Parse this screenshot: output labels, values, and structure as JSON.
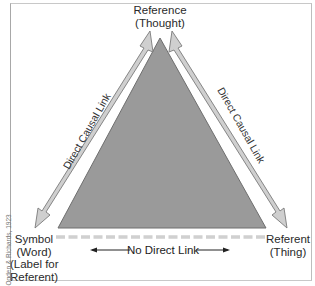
{
  "diagram": {
    "type": "semiotic-triangle",
    "nodes": {
      "top": {
        "line1": "Reference",
        "line2": "(Thought)"
      },
      "bottom_left": {
        "line1": "Symbol",
        "line2": "(Word)",
        "line3": "(Label for",
        "line4": "Referent)"
      },
      "bottom_right": {
        "line1": "Referent",
        "line2": "(Thing)"
      }
    },
    "edges": {
      "left": {
        "label": "Direct Causal Link",
        "style": "double-headed-arrow"
      },
      "right": {
        "label": "Direct Causal Link",
        "style": "double-headed-arrow"
      },
      "bottom": {
        "label": "No Direct Link",
        "style": "dashed-line"
      }
    },
    "credit": "Ogden & Richards, 1923",
    "colors": {
      "triangle_fill": "#9a9a9a",
      "triangle_stroke": "#6e6e6e",
      "arrow_fill": "#cfcfcf",
      "arrow_stroke": "#7a7a7a",
      "dash": "#d0d0d0"
    }
  }
}
